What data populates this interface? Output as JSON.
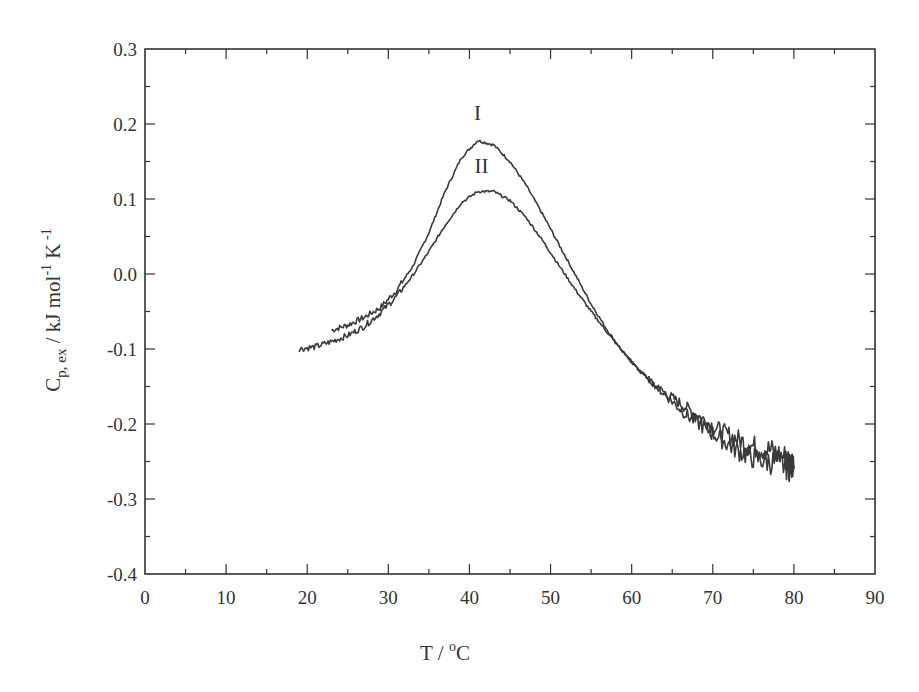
{
  "chart_data": {
    "type": "line",
    "title": "",
    "xlabel": "T / °C",
    "ylabel": "C_p,ex / kJ mol^-1 K^-1",
    "xlim": [
      0,
      90
    ],
    "ylim": [
      -0.4,
      0.3
    ],
    "grid": false,
    "legend": "none (curves labeled inline: I, II)",
    "x_ticks": [
      "0",
      "10",
      "20",
      "30",
      "40",
      "50",
      "60",
      "70",
      "80",
      "90"
    ],
    "y_ticks": [
      "0.3",
      "0.2",
      "0.1",
      "0.0",
      "-0.1",
      "-0.2",
      "-0.3",
      "-0.4"
    ],
    "series": [
      {
        "name": "I",
        "x": [
          23,
          25,
          27,
          29,
          31,
          33,
          35,
          37,
          39,
          41,
          43,
          45,
          47,
          49,
          51,
          53,
          55,
          57,
          59,
          61,
          63,
          65,
          67,
          69,
          71,
          73,
          75,
          77,
          79,
          80
        ],
        "y": [
          -0.075,
          -0.068,
          -0.058,
          -0.045,
          -0.022,
          0.01,
          0.055,
          0.11,
          0.155,
          0.178,
          0.172,
          0.15,
          0.118,
          0.08,
          0.04,
          0.0,
          -0.04,
          -0.075,
          -0.105,
          -0.13,
          -0.15,
          -0.165,
          -0.18,
          -0.195,
          -0.21,
          -0.22,
          -0.23,
          -0.235,
          -0.245,
          -0.255
        ]
      },
      {
        "name": "II",
        "x": [
          19,
          21,
          23,
          25,
          27,
          29,
          31,
          33,
          35,
          37,
          39,
          41,
          43,
          45,
          47,
          49,
          51,
          53,
          55,
          57,
          59,
          61,
          63,
          65,
          67,
          69,
          71,
          73,
          75,
          77,
          79,
          80
        ],
        "y": [
          -0.1,
          -0.097,
          -0.09,
          -0.082,
          -0.07,
          -0.052,
          -0.03,
          -0.002,
          0.03,
          0.065,
          0.095,
          0.11,
          0.11,
          0.098,
          0.075,
          0.045,
          0.012,
          -0.02,
          -0.05,
          -0.078,
          -0.105,
          -0.128,
          -0.15,
          -0.17,
          -0.19,
          -0.205,
          -0.22,
          -0.235,
          -0.245,
          -0.25,
          -0.255,
          -0.26
        ]
      }
    ],
    "annotations": [
      {
        "text": "I",
        "x": 41,
        "y": 0.205
      },
      {
        "text": "II",
        "x": 41.5,
        "y": 0.135
      }
    ]
  },
  "labels": {
    "x_axis_title_main": "T / ",
    "x_axis_title_sup": "o",
    "x_axis_title_unit": "C",
    "y_axis_title_main": "C",
    "y_axis_title_sub": "p, ex",
    "y_axis_title_mid": " / kJ mol",
    "y_axis_title_sup1": "-1",
    "y_axis_title_k": " K",
    "y_axis_title_sup2": " -1",
    "curve_I": "I",
    "curve_II": "II"
  },
  "colors": {
    "line": "#3a3a3a",
    "axis": "#333333",
    "background": "#ffffff"
  }
}
